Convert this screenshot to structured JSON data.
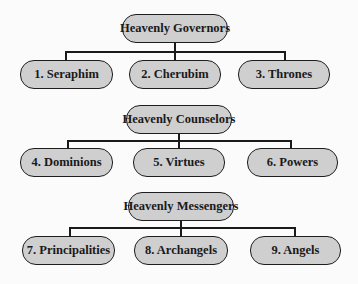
{
  "colors": {
    "background": "#fbfbfb",
    "node_fill": "#cfcfcf",
    "node_border": "#1e1e1e",
    "connector": "#1a1a1a"
  },
  "groups": [
    {
      "title": "Heavenly Governors",
      "members": [
        "1. Seraphim",
        "2. Cherubim",
        "3. Thrones"
      ]
    },
    {
      "title": "Heavenly Counselors",
      "members": [
        "4. Dominions",
        "5. Virtues",
        "6. Powers"
      ]
    },
    {
      "title": "Heavenly Messengers",
      "members": [
        "7. Principalities",
        "8. Archangels",
        "9. Angels"
      ]
    }
  ]
}
